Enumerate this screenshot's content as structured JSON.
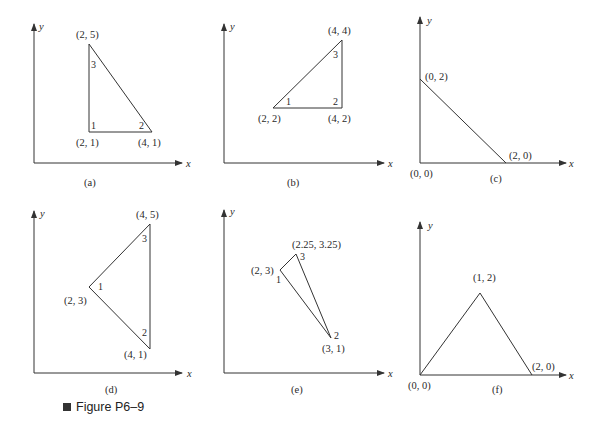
{
  "figure": {
    "caption": "Figure P6–9",
    "caption_icon": "black-square-bullet"
  },
  "panels": [
    {
      "id": "a",
      "label": "(a)",
      "shape": "triangle",
      "axes": {
        "x": "x",
        "y": "y"
      },
      "nodes": [
        {
          "number": "1",
          "coord": "(2, 1)"
        },
        {
          "number": "2",
          "coord": "(4, 1)"
        },
        {
          "number": "3",
          "coord": "(2, 5)"
        }
      ]
    },
    {
      "id": "b",
      "label": "(b)",
      "shape": "triangle",
      "axes": {
        "x": "x",
        "y": "y"
      },
      "nodes": [
        {
          "number": "1",
          "coord": "(2, 2)"
        },
        {
          "number": "2",
          "coord": "(4, 2)"
        },
        {
          "number": "3",
          "coord": "(4, 4)"
        }
      ]
    },
    {
      "id": "c",
      "label": "(c)",
      "shape": "triangle",
      "axes": {
        "x": "x",
        "y": "y"
      },
      "nodes": [
        {
          "number": "",
          "coord": "(0, 0)"
        },
        {
          "number": "",
          "coord": "(2, 0)"
        },
        {
          "number": "",
          "coord": "(0, 2)"
        }
      ]
    },
    {
      "id": "d",
      "label": "(d)",
      "shape": "triangle",
      "axes": {
        "x": "x",
        "y": "y"
      },
      "nodes": [
        {
          "number": "1",
          "coord": "(2, 3)"
        },
        {
          "number": "2",
          "coord": "(4, 1)"
        },
        {
          "number": "3",
          "coord": "(4, 5)"
        }
      ]
    },
    {
      "id": "e",
      "label": "(e)",
      "shape": "triangle",
      "axes": {
        "x": "x",
        "y": "y"
      },
      "nodes": [
        {
          "number": "1",
          "coord": "(2, 3)"
        },
        {
          "number": "2",
          "coord": "(3, 1)"
        },
        {
          "number": "3",
          "coord": "(2.25, 3.25)"
        }
      ]
    },
    {
      "id": "f",
      "label": "(f)",
      "shape": "triangle",
      "axes": {
        "x": "x",
        "y": "y"
      },
      "nodes": [
        {
          "number": "",
          "coord": "(0, 0)"
        },
        {
          "number": "",
          "coord": "(2, 0)"
        },
        {
          "number": "",
          "coord": "(1, 2)"
        }
      ]
    }
  ],
  "colors": {
    "line": "#333333",
    "text": "#2a2a2a",
    "background": "#ffffff"
  }
}
